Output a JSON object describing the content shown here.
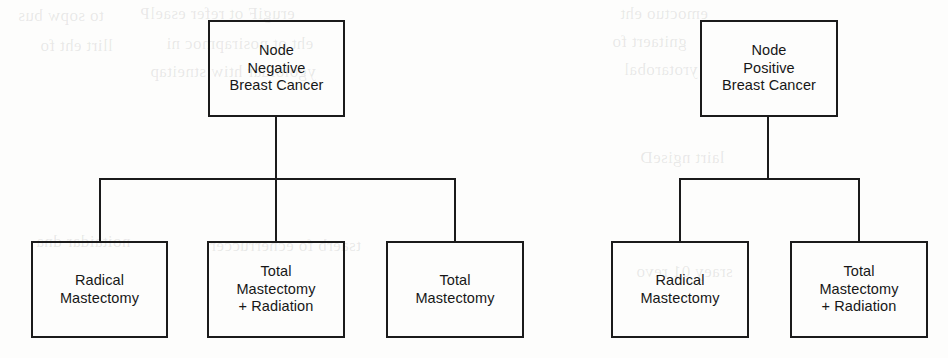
{
  "figure": {
    "background_color": "#fdfdfc",
    "line_color": "#1b1b1b",
    "text_color": "#171717"
  },
  "trees": [
    {
      "id": "node-negative",
      "root": {
        "name": "root-node-negative",
        "label": "Node\nNegative\nBreast Cancer",
        "x": 208,
        "y": 20,
        "w": 137,
        "h": 97
      },
      "connector": {
        "trunk_x": 276,
        "trunk_top": 117,
        "bar_y": 178,
        "bar_left": 100,
        "bar_right": 455,
        "drop_bottom": 241
      },
      "children": [
        {
          "name": "arm-radical-mastectomy",
          "label": "Radical\nMastectomy",
          "x": 31,
          "y": 241,
          "w": 137,
          "h": 97,
          "stub_x": 100
        },
        {
          "name": "arm-total-mastectomy-radiation",
          "label": "Total\nMastectomy\n+ Radiation",
          "x": 207,
          "y": 241,
          "w": 138,
          "h": 97,
          "stub_x": 276
        },
        {
          "name": "arm-total-mastectomy",
          "label": "Total\nMastectomy",
          "x": 386,
          "y": 241,
          "w": 138,
          "h": 97,
          "stub_x": 455
        }
      ]
    },
    {
      "id": "node-positive",
      "root": {
        "name": "root-node-positive",
        "label": "Node\nPositive\nBreast Cancer",
        "x": 700,
        "y": 20,
        "w": 138,
        "h": 97
      },
      "connector": {
        "trunk_x": 768,
        "trunk_top": 117,
        "bar_y": 178,
        "bar_left": 680,
        "bar_right": 859,
        "drop_bottom": 241
      },
      "children": [
        {
          "name": "arm-radical-mastectomy",
          "label": "Radical\nMastectomy",
          "x": 611,
          "y": 241,
          "w": 138,
          "h": 97,
          "stub_x": 680
        },
        {
          "name": "arm-total-mastectomy-radiation",
          "label": "Total\nMastectomy\n+ Radiation",
          "x": 790,
          "y": 241,
          "w": 138,
          "h": 97,
          "stub_x": 859
        }
      ]
    }
  ],
  "bleed_through": [
    {
      "text": "to sopw bus",
      "x": 18,
      "y": 6
    },
    {
      "text": "erugiF ot refer esaelP",
      "x": 140,
      "y": 4
    },
    {
      "text": "emoctuo eht",
      "x": 620,
      "y": 4
    },
    {
      "text": "llirt eht fo",
      "x": 40,
      "y": 36
    },
    {
      "text": "eht ot nosirapmoc ni",
      "x": 166,
      "y": 34
    },
    {
      "text": "gnitaert fo",
      "x": 612,
      "y": 32
    },
    {
      "text": "ygoloidar htiw stneitap",
      "x": 150,
      "y": 62
    },
    {
      "text": "yrotarobal",
      "x": 624,
      "y": 60
    },
    {
      "text": "lairt ngiseD",
      "x": 640,
      "y": 148
    },
    {
      "text": "noitaidar dna",
      "x": 36,
      "y": 232
    },
    {
      "text": "tsaerb fo ecnerruccer",
      "x": 210,
      "y": 236
    },
    {
      "text": "sraey 01 revo",
      "x": 636,
      "y": 262
    }
  ]
}
